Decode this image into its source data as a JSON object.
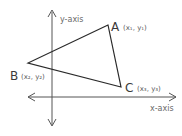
{
  "diagram": {
    "type": "coordinate-triangle",
    "axes": {
      "x_label": "x-axis",
      "y_label": "y-axis",
      "color": "#555555"
    },
    "triangle": {
      "stroke_color": "#2a2a2a",
      "vertices": [
        {
          "name": "A",
          "coords": "(x₁, y₁)"
        },
        {
          "name": "B",
          "coords": "(x₂, y₂)"
        },
        {
          "name": "C",
          "coords": "(x₃, y₃)"
        }
      ]
    }
  }
}
